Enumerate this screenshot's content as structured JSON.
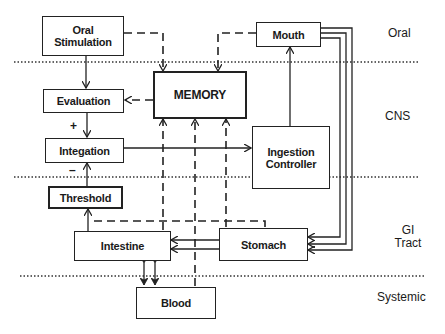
{
  "diagram": {
    "regions": [
      {
        "id": "oral",
        "label": "Oral"
      },
      {
        "id": "cns",
        "label": "CNS"
      },
      {
        "id": "gi",
        "label": "GI Tract"
      },
      {
        "id": "systemic",
        "label": "Systemic"
      }
    ],
    "nodes": {
      "oral_stimulation": "Oral Stimulation",
      "mouth": "Mouth",
      "memory": "MEMORY",
      "evaluation": "Evaluation",
      "integation": "Integation",
      "ingestion_controller": "Ingestion Controller",
      "threshold": "Threshold",
      "intestine": "Intestine",
      "stomach": "Stomach",
      "blood": "Blood"
    },
    "signs": {
      "plus": "+",
      "minus": "–"
    },
    "edges": [
      {
        "from": "Oral Stimulation",
        "to": "Evaluation",
        "style": "solid"
      },
      {
        "from": "Oral Stimulation",
        "to": "MEMORY",
        "style": "dashed"
      },
      {
        "from": "Mouth",
        "to": "MEMORY",
        "style": "dashed"
      },
      {
        "from": "MEMORY",
        "to": "Evaluation",
        "style": "dashed"
      },
      {
        "from": "Evaluation",
        "to": "Integation",
        "style": "solid",
        "sign": "+"
      },
      {
        "from": "Threshold",
        "to": "Integation",
        "style": "solid",
        "sign": "-"
      },
      {
        "from": "Integation",
        "to": "Ingestion Controller",
        "style": "solid"
      },
      {
        "from": "Ingestion Controller",
        "to": "Mouth",
        "style": "solid"
      },
      {
        "from": "Mouth",
        "to": "Stomach",
        "style": "triple solid"
      },
      {
        "from": "Stomach",
        "to": "Intestine",
        "style": "double solid"
      },
      {
        "from": "Intestine",
        "to": "Threshold",
        "style": "solid"
      },
      {
        "from": "Stomach",
        "to": "Threshold",
        "style": "dashed"
      },
      {
        "from": "Intestine",
        "to": "MEMORY",
        "style": "dashed"
      },
      {
        "from": "Blood",
        "to": "MEMORY",
        "style": "dashed"
      },
      {
        "from": "Stomach",
        "to": "MEMORY",
        "style": "dashed"
      },
      {
        "from": "Intestine",
        "to": "Blood",
        "style": "bidirectional double"
      }
    ]
  }
}
